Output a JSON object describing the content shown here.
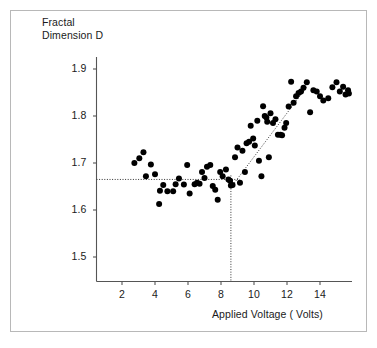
{
  "figure": {
    "background_color": "#ffffff",
    "frame_color": "#b8b8b8",
    "ink_color": "#1a1a1a"
  },
  "chart_data": {
    "type": "scatter",
    "title": "",
    "xlabel": "Applied Voltage ( Volts)",
    "ylabel": "Fractal\nDimension D",
    "xlim": [
      0.7,
      16.0
    ],
    "ylim": [
      1.44,
      1.93
    ],
    "xticks": [
      2,
      4,
      6,
      8,
      10,
      12,
      14
    ],
    "xtick_labels": [
      "2",
      "4",
      "6",
      "8",
      "10",
      "12",
      "14"
    ],
    "yticks": [
      1.5,
      1.6,
      1.7,
      1.8,
      1.9
    ],
    "ytick_labels": [
      "1.5",
      "1.6",
      "1.7",
      "1.8",
      "1.9"
    ],
    "grid": false,
    "legend": null,
    "marker": {
      "shape": "circle",
      "color": "#000000",
      "size": 4.2
    },
    "x": [
      2.75,
      3.05,
      3.3,
      3.45,
      3.75,
      4.0,
      4.25,
      4.3,
      4.5,
      4.75,
      5.1,
      5.25,
      5.45,
      5.75,
      5.95,
      6.1,
      6.4,
      6.55,
      6.7,
      6.85,
      7.0,
      7.15,
      7.35,
      7.5,
      7.65,
      7.8,
      7.95,
      8.1,
      8.3,
      8.45,
      8.55,
      8.6,
      8.7,
      8.85,
      9.0,
      9.15,
      9.3,
      9.45,
      9.55,
      9.7,
      9.8,
      9.95,
      10.05,
      10.2,
      10.3,
      10.45,
      10.55,
      10.65,
      10.75,
      10.8,
      10.9,
      11.0,
      11.15,
      11.3,
      11.45,
      11.6,
      11.7,
      11.85,
      11.95,
      12.1,
      12.25,
      12.4,
      12.55,
      12.7,
      12.85,
      13.0,
      13.2,
      13.4,
      13.6,
      13.8,
      14.0,
      14.2,
      14.5,
      14.75,
      15.0,
      15.2,
      15.4,
      15.55,
      15.7,
      15.75
    ],
    "y": [
      1.7,
      1.71,
      1.723,
      1.672,
      1.697,
      1.676,
      1.613,
      1.641,
      1.653,
      1.64,
      1.64,
      1.655,
      1.667,
      1.654,
      1.696,
      1.635,
      1.655,
      1.658,
      1.656,
      1.681,
      1.668,
      1.692,
      1.696,
      1.651,
      1.643,
      1.622,
      1.681,
      1.672,
      1.686,
      1.665,
      1.662,
      1.652,
      1.653,
      1.712,
      1.733,
      1.658,
      1.726,
      1.681,
      1.742,
      1.745,
      1.779,
      1.752,
      1.737,
      1.79,
      1.705,
      1.672,
      1.821,
      1.8,
      1.797,
      1.788,
      1.712,
      1.806,
      1.785,
      1.793,
      1.76,
      1.76,
      1.759,
      1.775,
      1.785,
      1.82,
      1.873,
      1.828,
      1.842,
      1.849,
      1.852,
      1.86,
      1.872,
      1.808,
      1.855,
      1.852,
      1.842,
      1.833,
      1.838,
      1.861,
      1.872,
      1.852,
      1.862,
      1.846,
      1.855,
      1.848
    ],
    "annotations": {
      "threshold_vertical_voltage": 8.6,
      "threshold_horizontal_dimension": 1.665,
      "fit_line": {
        "x_start": 8.6,
        "y_start": 1.648,
        "x_end": 13.2,
        "y_end": 1.862,
        "style": "dotted"
      },
      "guide_line_style": "dotted"
    }
  }
}
